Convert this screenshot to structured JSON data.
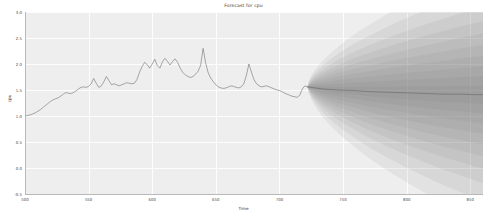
{
  "chart_data": {
    "type": "line",
    "title": "Forecast for cpu",
    "xlabel": "Time",
    "ylabel": "cpu",
    "grid": true,
    "legend": "none",
    "xlim": [
      500,
      860
    ],
    "ylim": [
      -0.5,
      3.0
    ],
    "xticks": [
      500,
      550,
      600,
      650,
      700,
      750,
      800,
      850
    ],
    "xtick_labels": [
      "500",
      "550",
      "600",
      "650",
      "700",
      "750",
      "800",
      "850"
    ],
    "yticks": [
      -0.5,
      0.0,
      0.5,
      1.0,
      1.5,
      2.0,
      2.5,
      3.0
    ],
    "ytick_labels": [
      "-0.5",
      "0.0",
      "0.5",
      "1.0",
      "1.5",
      "2.0",
      "2.5",
      "3.0"
    ],
    "forecast_start": 722,
    "colors": {
      "line": "#5a5a5a",
      "band": "#6e6e6e",
      "plot_background": "#eeeeee",
      "grid": "#fdfdfd",
      "text": "#4a4a4a",
      "figure_background": "#ffffff"
    },
    "series": [
      {
        "name": "history",
        "kind": "observed",
        "x": [
          500,
          502,
          504,
          506,
          508,
          510,
          512,
          514,
          516,
          518,
          520,
          522,
          524,
          526,
          528,
          530,
          532,
          534,
          536,
          538,
          540,
          542,
          544,
          546,
          548,
          550,
          552,
          554,
          556,
          558,
          560,
          562,
          564,
          566,
          568,
          570,
          572,
          574,
          576,
          578,
          580,
          582,
          584,
          586,
          588,
          590,
          592,
          594,
          596,
          598,
          600,
          602,
          604,
          606,
          608,
          610,
          612,
          614,
          616,
          618,
          620,
          622,
          624,
          626,
          628,
          630,
          632,
          634,
          636,
          638,
          640,
          642,
          644,
          646,
          648,
          650,
          652,
          654,
          656,
          658,
          660,
          662,
          664,
          666,
          668,
          670,
          672,
          674,
          676,
          678,
          680,
          682,
          684,
          686,
          688,
          690,
          692,
          694,
          696,
          698,
          700,
          702,
          704,
          706,
          708,
          710,
          712,
          714,
          716,
          718,
          720,
          722
        ],
        "y": [
          1.0,
          1.01,
          1.02,
          1.04,
          1.06,
          1.09,
          1.12,
          1.16,
          1.2,
          1.24,
          1.28,
          1.31,
          1.33,
          1.35,
          1.38,
          1.42,
          1.45,
          1.44,
          1.43,
          1.45,
          1.48,
          1.52,
          1.55,
          1.56,
          1.55,
          1.57,
          1.62,
          1.72,
          1.63,
          1.55,
          1.58,
          1.66,
          1.76,
          1.68,
          1.6,
          1.62,
          1.6,
          1.58,
          1.6,
          1.62,
          1.64,
          1.63,
          1.62,
          1.63,
          1.7,
          1.84,
          1.95,
          2.03,
          1.99,
          1.92,
          2.0,
          2.09,
          1.97,
          1.92,
          2.04,
          2.11,
          2.05,
          1.98,
          2.05,
          2.1,
          2.03,
          1.92,
          1.84,
          1.79,
          1.76,
          1.74,
          1.76,
          1.8,
          1.86,
          1.97,
          2.3,
          2.02,
          1.83,
          1.73,
          1.66,
          1.6,
          1.56,
          1.54,
          1.53,
          1.54,
          1.56,
          1.58,
          1.57,
          1.55,
          1.54,
          1.56,
          1.62,
          1.78,
          2.0,
          1.84,
          1.7,
          1.62,
          1.58,
          1.56,
          1.57,
          1.58,
          1.56,
          1.54,
          1.52,
          1.5,
          1.49,
          1.47,
          1.44,
          1.42,
          1.4,
          1.38,
          1.37,
          1.36,
          1.4,
          1.52,
          1.58,
          1.56
        ]
      },
      {
        "name": "forecast_mean",
        "kind": "predicted",
        "x": [
          722,
          734,
          746,
          758,
          770,
          782,
          794,
          806,
          818,
          830,
          842,
          854,
          860
        ],
        "y": [
          1.56,
          1.52,
          1.5,
          1.49,
          1.47,
          1.46,
          1.45,
          1.44,
          1.43,
          1.42,
          1.42,
          1.41,
          1.41
        ]
      }
    ],
    "confidence_bands": [
      {
        "level": "10%",
        "opacity": 0.09,
        "half_width_at_end": 0.18
      },
      {
        "level": "20%",
        "opacity": 0.09,
        "half_width_at_end": 0.36
      },
      {
        "level": "30%",
        "opacity": 0.09,
        "half_width_at_end": 0.55
      },
      {
        "level": "40%",
        "opacity": 0.09,
        "half_width_at_end": 0.75
      },
      {
        "level": "50%",
        "opacity": 0.09,
        "half_width_at_end": 0.96
      },
      {
        "level": "60%",
        "opacity": 0.09,
        "half_width_at_end": 1.18
      },
      {
        "level": "70%",
        "opacity": 0.09,
        "half_width_at_end": 1.42
      },
      {
        "level": "80%",
        "opacity": 0.09,
        "half_width_at_end": 1.7
      },
      {
        "level": "90%",
        "opacity": 0.09,
        "half_width_at_end": 2.05
      },
      {
        "level": "95%",
        "opacity": 0.09,
        "half_width_at_end": 2.45
      }
    ]
  }
}
